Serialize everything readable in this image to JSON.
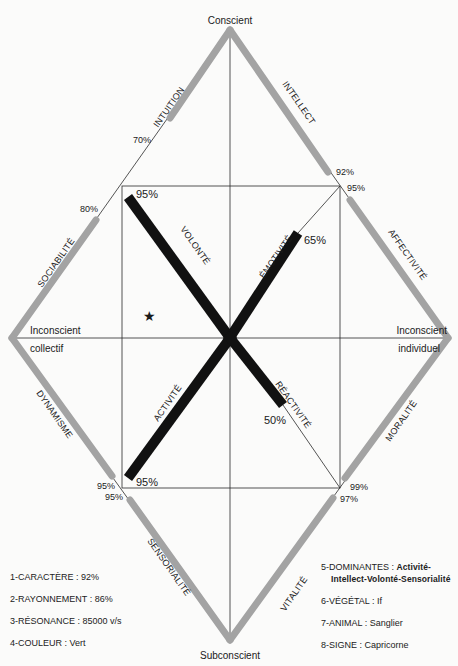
{
  "poles": {
    "top": "Conscient",
    "bottom": "Subconscient",
    "left_line1": "Inconscient",
    "left_line2": "collectif",
    "right_line1": "Inconscient",
    "right_line2": "individuel"
  },
  "outer_traits": {
    "intuition": {
      "label": "INTUITION",
      "value": "70%"
    },
    "intellect": {
      "label": "INTELLECT",
      "value": "92%"
    },
    "sociabilite": {
      "label": "SOCIABILITÉ",
      "value": "80%"
    },
    "affectivite": {
      "label": "AFFECTIVITÉ",
      "value": "95%"
    },
    "dynamisme": {
      "label": "DYNAMISME",
      "value": "95%"
    },
    "moralite": {
      "label": "MORALITÉ",
      "value": "99%"
    },
    "sensorialite": {
      "label": "SENSORIALITÉ",
      "value": "95%"
    },
    "vitalite": {
      "label": "VITALITÉ",
      "value": "97%"
    }
  },
  "inner_traits": {
    "volonte": {
      "label": "VOLONTÉ",
      "value": "95%"
    },
    "emotivite": {
      "label": "ÉMOTIVITÉ",
      "value": "65%"
    },
    "activite": {
      "label": "ACTIVITÉ",
      "value": "95%"
    },
    "reactivite": {
      "label": "RÉACTIVITÉ",
      "value": "50%"
    }
  },
  "marker": "★",
  "legend_left": [
    "1-CARACTÈRE : 92%",
    "2-RAYONNEMENT : 86%",
    "3-RÉSONANCE : 85000 v/s",
    "4-COULEUR : Vert"
  ],
  "legend_right": {
    "item5_label": "5-DOMINANTES : ",
    "item5_value_1": "Activité-",
    "item5_value_2": "Intellect-Volonté-Sensorialité",
    "item6": "6-VÉGÉTAL : If",
    "item7": "7-ANIMAL : Sanglier",
    "item8": "8-SIGNE : Capricorne"
  },
  "colors": {
    "outer_bar": "#a3a3a3",
    "inner_bar": "#111111",
    "line": "#2a2a2a",
    "background": "#fbfbfa"
  }
}
